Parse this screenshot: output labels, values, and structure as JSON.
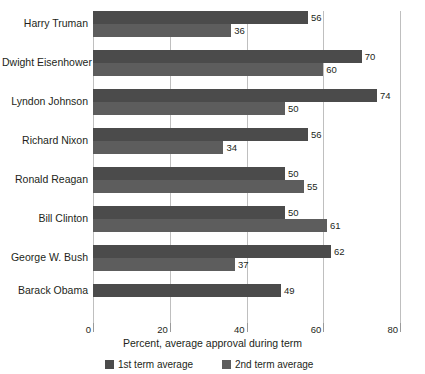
{
  "chart_data": {
    "type": "bar",
    "orientation": "horizontal",
    "title": "",
    "xlabel": "Percent, average approval during term",
    "ylabel": "",
    "xlim": [
      0,
      80
    ],
    "xticks": [
      0,
      20,
      40,
      60,
      80
    ],
    "grid": true,
    "legend_position": "bottom-left",
    "categories": [
      "Harry Truman",
      "Dwight Eisenhower",
      "Lyndon Johnson",
      "Richard Nixon",
      "Ronald Reagan",
      "Bill Clinton",
      "George W. Bush",
      "Barack Obama"
    ],
    "series": [
      {
        "name": "1st term average",
        "color": "#4b4b4b",
        "values": [
          56,
          70,
          74,
          56,
          50,
          50,
          62,
          49
        ]
      },
      {
        "name": "2nd term average",
        "color": "#5d5d5d",
        "values": [
          36,
          60,
          50,
          34,
          55,
          61,
          37,
          null
        ]
      }
    ]
  },
  "colors": {
    "series_1": "#4b4b4b",
    "series_2": "#5d5d5d",
    "gridline": "#bfbfbf",
    "axis": "#8a8a8a",
    "text": "#231f20",
    "background": "#ffffff"
  }
}
